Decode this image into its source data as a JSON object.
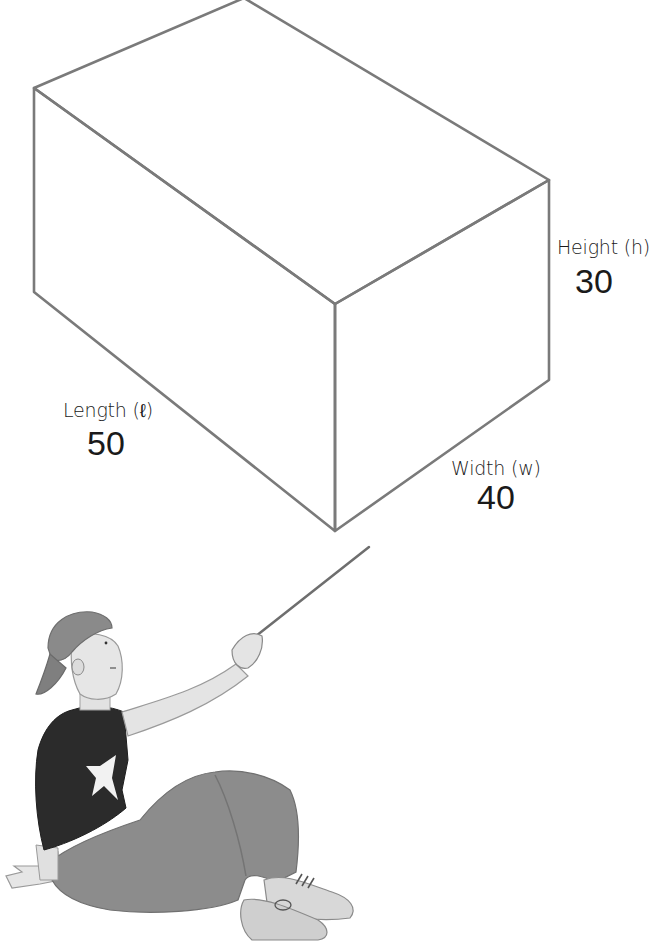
{
  "figure": {
    "type": "rectangular-prism",
    "stroke_color": "#7a7a7a",
    "dimensions": {
      "height": {
        "name": "Height (h)",
        "value": "30"
      },
      "length": {
        "name": "Length (ℓ)",
        "value": "50"
      },
      "width": {
        "name": "Width (w)",
        "value": "40"
      }
    }
  },
  "illustration": {
    "subject": "boy sitting and pointing at the box with a pointer stick",
    "colors": {
      "shirt": "#2b2b2b",
      "pants": "#8c8c8c",
      "skin": "#e4e4e4",
      "cap": "#8a8a8a"
    }
  }
}
